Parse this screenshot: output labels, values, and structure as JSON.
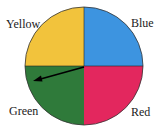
{
  "spinner": {
    "sections": [
      {
        "label": "Yellow",
        "color": "#f2c33c"
      },
      {
        "label": "Blue",
        "color": "#3d94e0"
      },
      {
        "label": "Red",
        "color": "#e3275e"
      },
      {
        "label": "Green",
        "color": "#2f7a3a"
      }
    ],
    "pointer": {
      "points_to": "Green"
    }
  }
}
